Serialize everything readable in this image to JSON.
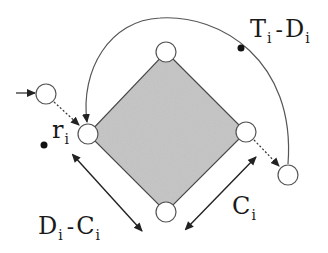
{
  "diagram": {
    "colors": {
      "diamond_fill": "#c4c4c4",
      "stroke": "#555555",
      "node_fill": "#ffffff",
      "dot": "#111111"
    },
    "nodes": [
      {
        "id": "top",
        "x": 166,
        "y": 52
      },
      {
        "id": "left",
        "x": 88,
        "y": 134
      },
      {
        "id": "right",
        "x": 246,
        "y": 132
      },
      {
        "id": "bottom",
        "x": 166,
        "y": 212
      },
      {
        "id": "entry",
        "x": 46,
        "y": 94
      },
      {
        "id": "exit",
        "x": 288,
        "y": 174
      }
    ],
    "labels": {
      "ti_di": {
        "main": "T",
        "sub": "i",
        "op": "-",
        "main2": "D",
        "sub2": "i"
      },
      "ri": {
        "main": "r",
        "sub": "i"
      },
      "di_ci": {
        "main": "D",
        "sub": "i",
        "op": "-",
        "main2": "C",
        "sub2": "i"
      },
      "ci": {
        "main": "C",
        "sub": "i"
      }
    }
  }
}
